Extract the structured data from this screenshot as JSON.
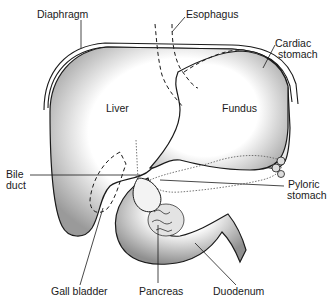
{
  "diagram": {
    "labels": {
      "diaphragm": "Diaphragm",
      "esophagus": "Esophagus",
      "cardiac_stomach_line1": "Cardiac",
      "cardiac_stomach_line2": "stomach",
      "liver": "Liver",
      "fundus": "Fundus",
      "bile_duct_line1": "Bile",
      "bile_duct_line2": "duct",
      "pyloric_stomach_line1": "Pyloric",
      "pyloric_stomach_line2": "stomach",
      "gall_bladder": "Gall bladder",
      "pancreas": "Pancreas",
      "duodenum": "Duodenum"
    },
    "colors": {
      "ink": "#1a1a1a",
      "stipple": "#bdbdbd",
      "background": "#ffffff"
    }
  }
}
